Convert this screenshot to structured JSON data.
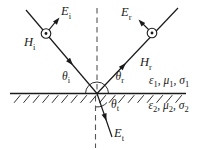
{
  "figure": {
    "description_labels_only": "plane-wave-oblique-incidence-diagram",
    "colors": {
      "ink": "#1a1a1a",
      "normal_line": "#555555",
      "background": "#ffffff"
    },
    "icons": {
      "incident_field_dot": "circle-dot-out-of-page",
      "reflected_field_dot": "circle-dot-out-of-page"
    },
    "labels": {
      "E_i": {
        "main": "E",
        "sub": "i"
      },
      "H_i": {
        "main": "H",
        "sub": "i"
      },
      "E_r": {
        "main": "E",
        "sub": "r"
      },
      "H_r": {
        "main": "H",
        "sub": "r"
      },
      "E_t": {
        "main": "E",
        "sub": "t"
      },
      "theta_i": {
        "main": "θ",
        "sub": "i"
      },
      "theta_r": {
        "main": "θ",
        "sub": "r"
      },
      "theta_t": {
        "main": "θ",
        "sub": "t"
      },
      "medium1": {
        "sym1": "ε",
        "sub1": "1",
        "sym2": ", μ",
        "sub2": "1",
        "sym3": ", σ",
        "sub3": "1"
      },
      "medium2": {
        "sym1": "ε",
        "sub1": "2",
        "sym2": ", μ",
        "sub2": "2",
        "sym3": ", σ",
        "sub3": "2"
      }
    }
  }
}
